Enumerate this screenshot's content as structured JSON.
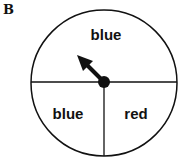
{
  "panel_label": "B",
  "spinner": {
    "sections": [
      {
        "label": "blue",
        "position": "top-half"
      },
      {
        "label": "blue",
        "position": "bottom-left-quarter"
      },
      {
        "label": "red",
        "position": "bottom-right-quarter"
      }
    ],
    "arrow_direction": "up-left"
  },
  "colors": {
    "stroke": "#111111",
    "background": "#ffffff"
  }
}
